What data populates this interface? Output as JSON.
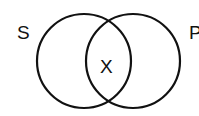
{
  "diagram": {
    "type": "venn",
    "sets": [
      {
        "label": "S",
        "cx": 84,
        "cy": 61,
        "r": 47
      },
      {
        "label": "P",
        "cx": 133,
        "cy": 61,
        "r": 47
      }
    ],
    "intersection_label": "X",
    "stroke_color": "#111111",
    "background": "#ffffff"
  }
}
